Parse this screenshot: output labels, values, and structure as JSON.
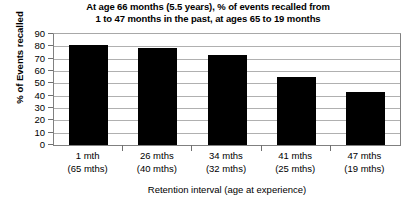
{
  "chart_data": {
    "type": "bar",
    "title": "At age 66 months (5.5 years), % of events recalled from 1 to 47 months in the past, at ages 65 to 19 months",
    "title_lines": [
      "At age 66 months (5.5 years), % of events recalled from",
      "1 to 47 months in the past, at ages 65 to 19 months"
    ],
    "xlabel": "Retention interval (age at experience)",
    "ylabel": "% of Events recalled",
    "categories": [
      "1 mth",
      "26 mths",
      "34 mths",
      "41 mths",
      "47 mths"
    ],
    "category_sublabels": [
      "(65 mths)",
      "(40 mths)",
      "(32 mths)",
      "(25 mths)",
      "(19 mths)"
    ],
    "values": [
      81,
      79,
      73,
      55,
      43
    ],
    "ylim": [
      0,
      90
    ],
    "yticks": [
      0,
      10,
      20,
      30,
      40,
      50,
      60,
      70,
      80,
      90
    ],
    "ytick_labels": [
      "0",
      "10",
      "20",
      "30",
      "40",
      "50",
      "60",
      "70",
      "80",
      "90"
    ],
    "grid": true,
    "legend": null,
    "bar_color": "#000000",
    "grid_color": "#b0b0b0",
    "axis_color": "#808080"
  }
}
